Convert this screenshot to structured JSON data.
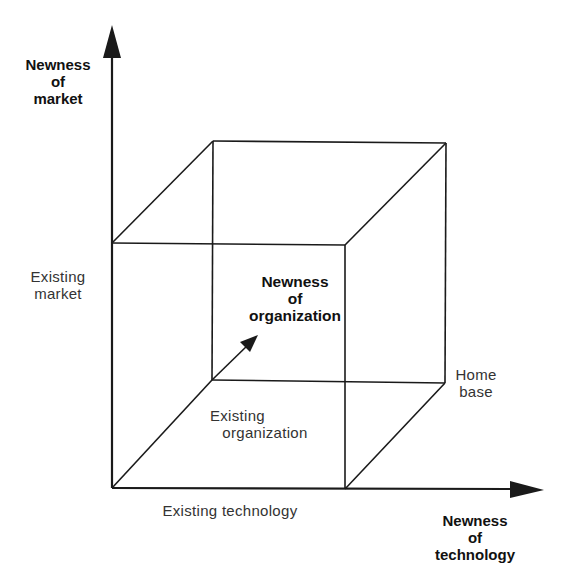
{
  "diagram": {
    "type": "3d-cube-axes",
    "axes": {
      "vertical": {
        "label_lines": [
          "Newness",
          "of",
          "market"
        ],
        "baseline_label_lines": [
          "Existing",
          "market"
        ]
      },
      "horizontal": {
        "label_lines": [
          "Newness",
          "of",
          "technology"
        ],
        "baseline_label": "Existing technology"
      },
      "depth": {
        "label_lines": [
          "Newness",
          "of",
          "organization"
        ],
        "baseline_label_lines": [
          "Existing",
          "organization"
        ]
      }
    },
    "origin_label_lines": [
      "Home",
      "base"
    ],
    "colors": {
      "line": "#1a1a1a",
      "background": "#ffffff"
    }
  }
}
